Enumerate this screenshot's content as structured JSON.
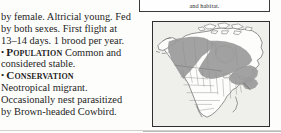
{
  "page": {
    "type": "field-guide-page-fragment",
    "background_color": "#fdfdfc",
    "text_color": "#1d1d1d"
  },
  "top_box": {
    "text": "and habitat.",
    "border_color": "#3b3b3b"
  },
  "body_text": {
    "lines": [
      "by female. Altricial young. Fed",
      "by both sexes. First flight at",
      "13–14 days. 1 brood per year."
    ]
  },
  "sections": [
    {
      "bullet": "•",
      "heading": "Population",
      "first_line_rest": "Common and",
      "lines": [
        "considered stable."
      ]
    },
    {
      "bullet": "•",
      "heading": "Conservation",
      "first_line_rest": "",
      "lines": [
        "Neotropical migrant.",
        "Occasionally nest parasitized",
        "by Brown-headed Cowbird."
      ]
    }
  ],
  "map": {
    "name": "north-america-range-map",
    "title": "",
    "region": "North America",
    "ocean_color": "#efefec",
    "land_color": "#fdfdfb",
    "range_color": "#9a9a9a",
    "outline_color": "#4a4a4a",
    "state_line_color": "#8d8d8d",
    "border_color": "#2e2e2e",
    "range_description": "Breeding range shaded gray: from Alaska and northwestern Canada diagonally southeast across the Canadian provinces to the Great Lakes and the northeastern United States."
  }
}
